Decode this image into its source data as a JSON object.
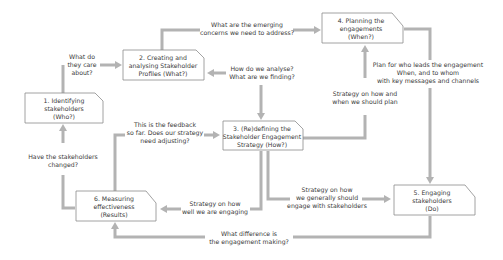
{
  "diagram": {
    "colors": {
      "connector": "#b3b3b3",
      "box_border": "#8a8a8a",
      "text": "#3a3a3a",
      "background": "#ffffff"
    },
    "nodes": [
      {
        "id": "n1",
        "lines": [
          "1. Identifying",
          "stakeholders",
          "(Who?)"
        ]
      },
      {
        "id": "n2",
        "lines": [
          "2. Creating and",
          "analysing Stakeholder",
          "Profiles (What?)"
        ]
      },
      {
        "id": "n3",
        "lines": [
          "3. (Re)defining the",
          "Stakeholder Engagement",
          "Strategy (How?)"
        ]
      },
      {
        "id": "n4",
        "lines": [
          "4. Planning the",
          "engagements",
          "(When?)"
        ]
      },
      {
        "id": "n5",
        "lines": [
          "5. Engaging",
          "stakeholders",
          "(Do)"
        ]
      },
      {
        "id": "n6",
        "lines": [
          "6. Measuring",
          "effectiveness",
          "(Results)"
        ]
      }
    ],
    "edges": [
      {
        "id": "e1_2",
        "from": "n1",
        "to": "n2",
        "lines": [
          "What do",
          "they care",
          "about?"
        ]
      },
      {
        "id": "e2_4",
        "from": "n2",
        "to": "n4",
        "lines": [
          "What are the emerging",
          "concerns we need to address?"
        ]
      },
      {
        "id": "e3_2",
        "from": "n3",
        "to": "n2",
        "lines": [
          "How do we analyse?",
          "What are we finding?"
        ]
      },
      {
        "id": "e3_4",
        "from": "n3",
        "to": "n4",
        "lines": [
          "Strategy on how and",
          "when we should plan"
        ]
      },
      {
        "id": "e4_5",
        "from": "n4",
        "to": "n5",
        "lines": [
          "Plan for who leads the engagement",
          "When, and to whom",
          "with key messages and channels"
        ]
      },
      {
        "id": "e6_3",
        "from": "n6",
        "to": "n3",
        "lines": [
          "This is the feedback",
          "so far. Does our strategy",
          "need adjusting?"
        ]
      },
      {
        "id": "e6_1",
        "from": "n6",
        "to": "n1",
        "lines": [
          "Have the stakeholders",
          "changed?"
        ]
      },
      {
        "id": "e3_6",
        "from": "n3",
        "to": "n6",
        "lines": [
          "Strategy on how",
          "well we are engaging"
        ]
      },
      {
        "id": "e3_5",
        "from": "n3",
        "to": "n5",
        "lines": [
          "Strategy on how",
          "we generally should",
          "engage with stakeholders"
        ]
      },
      {
        "id": "e5_6",
        "from": "n5",
        "to": "n6",
        "lines": [
          "What difference is",
          "the engagement making?"
        ]
      }
    ]
  }
}
